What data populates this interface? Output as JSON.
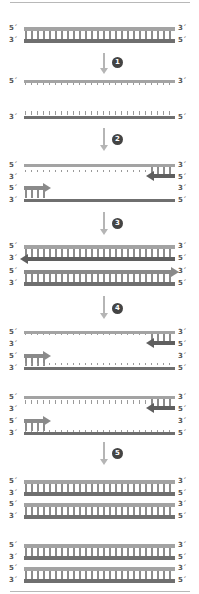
{
  "diagram": {
    "type": "PCR cycle schematic",
    "colors": {
      "template_strand": "#a3a3a3",
      "complement_strand": "#6f6f6f",
      "primer_forward": "#8a8a8a",
      "primer_reverse": "#5f5f5f",
      "step_circle": "#444444",
      "arrow": "#b5b5b5"
    },
    "end_labels": {
      "five_prime": "5´",
      "three_prime": "3´"
    },
    "steps": [
      {
        "number": "1"
      },
      {
        "number": "2"
      },
      {
        "number": "3"
      },
      {
        "number": "4"
      },
      {
        "number": "5"
      }
    ]
  }
}
